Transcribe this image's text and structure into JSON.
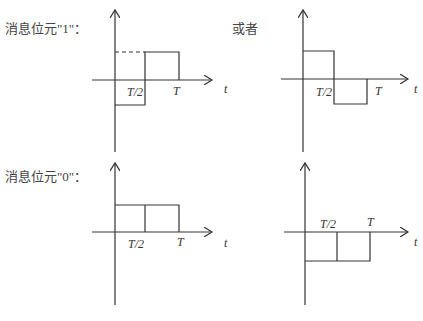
{
  "rows": [
    {
      "label": "消息位元\"1\"：",
      "or_label": "或者",
      "left_chart": {
        "tick_half": "T/2",
        "tick_full": "T",
        "axis_label": "t",
        "waveform": "negative first half, positive second half"
      },
      "right_chart": {
        "tick_half": "T/2",
        "tick_full": "T",
        "axis_label": "t",
        "waveform": "positive first half, negative second half"
      }
    },
    {
      "label": "消息位元\"0\"：",
      "left_chart": {
        "tick_half": "T/2",
        "tick_full": "T",
        "axis_label": "t",
        "waveform": "positive constant over [0,T]"
      },
      "right_chart": {
        "tick_half": "T/2",
        "tick_full": "T",
        "axis_label": "t",
        "waveform": "negative constant over [0,T]"
      }
    }
  ]
}
